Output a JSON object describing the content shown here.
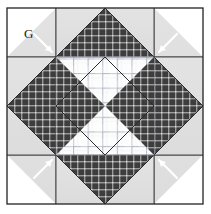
{
  "figure": {
    "canvas": {
      "width": 211,
      "height": 214,
      "background": "#ffffff"
    },
    "block": {
      "name": "octagon-star-quilt-block",
      "x": 7,
      "y": 8,
      "size": 196,
      "grid_units": 4,
      "unit_size": 49,
      "outline_color": "#222222"
    },
    "labels": [
      {
        "id": "g",
        "text": "G",
        "x": 24,
        "y": 33
      }
    ],
    "leaders": [
      {
        "id": "leader-top-left",
        "x1": 36,
        "y1": 36,
        "x2": 50,
        "y2": 50
      },
      {
        "id": "leader-top-right",
        "x1": 175,
        "y1": 36,
        "x2": 161,
        "y2": 50
      },
      {
        "id": "leader-bottom-left",
        "x1": 36,
        "y1": 176,
        "x2": 50,
        "y2": 162
      },
      {
        "id": "leader-bottom-right",
        "x1": 175,
        "y1": 176,
        "x2": 161,
        "y2": 162
      }
    ],
    "colors": {
      "background": "#ffffff",
      "light_fabric": "#e0e0e0",
      "dark_fabric": "#3a3a3a",
      "dark_check_light": "#8f8f8f",
      "plaid_base": "#fdfdfd",
      "plaid_line": "#b8bec8",
      "outline": "#222222",
      "leader": "#ffffff",
      "label_text": "#1a1a1a"
    },
    "patches": [
      {
        "id": "corner-tl-light",
        "fabric": "light",
        "shape": "half-square-triangle",
        "unit": "corner top-left"
      },
      {
        "id": "corner-tl-dark",
        "fabric": "dark-check",
        "shape": "small-triangle",
        "unit": "corner top-left inner",
        "label": "G"
      },
      {
        "id": "corner-tr-light",
        "fabric": "light",
        "shape": "half-square-triangle",
        "unit": "corner top-right"
      },
      {
        "id": "corner-tr-dark",
        "fabric": "dark-check",
        "shape": "small-triangle",
        "unit": "corner top-right inner"
      },
      {
        "id": "corner-bl-light",
        "fabric": "light",
        "shape": "half-square-triangle",
        "unit": "corner bottom-left"
      },
      {
        "id": "corner-bl-dark",
        "fabric": "dark-check",
        "shape": "small-triangle",
        "unit": "corner bottom-left inner"
      },
      {
        "id": "corner-br-light",
        "fabric": "light",
        "shape": "half-square-triangle",
        "unit": "corner bottom-right"
      },
      {
        "id": "corner-br-dark",
        "fabric": "dark-check",
        "shape": "small-triangle",
        "unit": "corner bottom-right inner"
      },
      {
        "id": "point-top",
        "fabric": "dark-check",
        "shape": "triangle",
        "unit": "top edge center"
      },
      {
        "id": "point-right",
        "fabric": "dark-check",
        "shape": "triangle",
        "unit": "right edge center"
      },
      {
        "id": "point-bottom",
        "fabric": "dark-check",
        "shape": "triangle",
        "unit": "bottom edge center"
      },
      {
        "id": "point-left",
        "fabric": "dark-check",
        "shape": "triangle",
        "unit": "left edge center"
      },
      {
        "id": "center-octagon",
        "fabric": "plaid",
        "shape": "octagon",
        "unit": "center"
      }
    ]
  }
}
